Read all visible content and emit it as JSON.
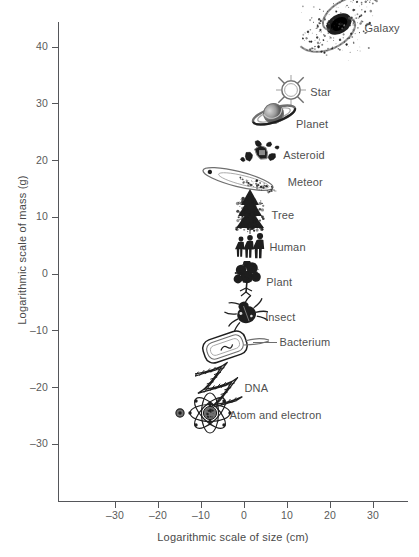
{
  "chart_data": {
    "type": "scatter",
    "title": "",
    "subtitle": "",
    "xlabel": "Logarithmic scale of size (cm)",
    "ylabel": "Logarithmic scale of mass (g)",
    "xlim": [
      -36,
      35
    ],
    "ylim": [
      -30,
      54
    ],
    "xticks": [
      -30,
      -20,
      -10,
      0,
      10,
      20,
      30
    ],
    "xticklabels": [
      "–30",
      "–20",
      "–10",
      "0",
      "10",
      "20",
      "30"
    ],
    "yticks": [
      -30,
      -20,
      -10,
      0,
      10,
      20,
      30,
      40,
      50
    ],
    "yticklabels": [
      "–30",
      "–20",
      "–10",
      "0",
      "10",
      "20",
      "30",
      "40",
      "50"
    ],
    "grid": false,
    "legend": false,
    "legend_position": "none",
    "annotation_style": "pictogram icons labelled in place",
    "points": [
      {
        "label": "Galaxy",
        "icon": "galaxy-icon",
        "x": 22,
        "y": 44,
        "label_dx": 26,
        "label_dy": 4
      },
      {
        "label": "Star",
        "icon": "star-icon",
        "x": 11,
        "y": 32.5,
        "label_dx": 19,
        "label_dy": 2
      },
      {
        "label": "Planet",
        "icon": "planet-icon",
        "x": 7,
        "y": 28,
        "label_dx": 22,
        "label_dy": 9
      },
      {
        "label": "Asteroid",
        "icon": "asteroid-icon",
        "x": 4,
        "y": 21.5,
        "label_dx": 22,
        "label_dy": 3
      },
      {
        "label": "Meteor",
        "icon": "meteor-icon",
        "x": -1,
        "y": 16.5,
        "label_dx": 48,
        "label_dy": 2
      },
      {
        "label": "Tree",
        "icon": "tree-icon",
        "x": 1.5,
        "y": 11,
        "label_dx": 21,
        "label_dy": 3
      },
      {
        "label": "Human",
        "icon": "human-icon",
        "x": 1.5,
        "y": 5,
        "label_dx": 19,
        "label_dy": 1
      },
      {
        "label": "Plant",
        "icon": "plant-icon",
        "x": 1,
        "y": -1,
        "label_dx": 18,
        "label_dy": 2
      },
      {
        "label": "Insect",
        "icon": "insect-icon",
        "x": 0.5,
        "y": -7,
        "label_dx": 19,
        "label_dy": 3
      },
      {
        "label": "Bacterium",
        "icon": "bacterium-icon",
        "x": -2,
        "y": -13,
        "label_dx": 44,
        "label_dy": -6
      },
      {
        "label": "DNA",
        "icon": "dna-icon",
        "x": -5,
        "y": -19,
        "label_dx": 22,
        "label_dy": 6
      },
      {
        "label": "Atom and electron",
        "icon": "atom-icon",
        "x": -8,
        "y": -24.5,
        "label_dx": 20,
        "label_dy": 2
      },
      {
        "label": "",
        "icon": "electron-icon",
        "x": -15,
        "y": -24.5,
        "label_dx": 0,
        "label_dy": 0
      }
    ],
    "colors": {
      "axis": "#55565a",
      "text": "#4a4a4a",
      "icon_dark": "#1e1e1e",
      "icon_mid": "#808080",
      "background": "#ffffff"
    }
  }
}
